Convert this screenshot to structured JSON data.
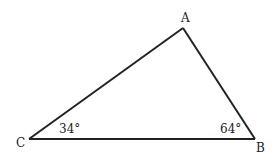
{
  "diagram": {
    "type": "triangle",
    "vertices": [
      {
        "id": "A",
        "label": "A"
      },
      {
        "id": "B",
        "label": "B"
      },
      {
        "id": "C",
        "label": "C"
      }
    ],
    "sides": [
      {
        "from": "C",
        "to": "A"
      },
      {
        "from": "A",
        "to": "B"
      },
      {
        "from": "B",
        "to": "C"
      }
    ],
    "angles": [
      {
        "vertex": "C",
        "label": "34°",
        "degrees": 34
      },
      {
        "vertex": "B",
        "label": "64°",
        "degrees": 64
      }
    ],
    "colors": {
      "stroke": "#222222",
      "background": "#ffffff"
    }
  }
}
